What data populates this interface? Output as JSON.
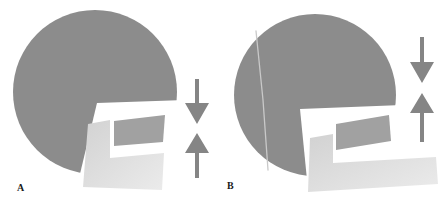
{
  "figure": {
    "type": "schematic-diagram",
    "panel_count": 2
  },
  "colors": {
    "background": "#ffffff",
    "skull": "#8c8c8c",
    "quad": "#a1a1a1",
    "jaw_light": "#d2d2d2",
    "jaw_light_fade": "#ebebeb",
    "arrow": "#858585",
    "fracture_line": "#c9c9c9",
    "label": "#1a1a1a"
  },
  "icons": {
    "down_arrow": "arrow-down",
    "up_arrow": "arrow-up"
  },
  "panels": [
    {
      "label": "A",
      "skull": {
        "cx": 95,
        "cy": 92,
        "r": 82
      },
      "notch_points": "79,178 97,103 185,100 196,200 85,200",
      "jaw_points": "88,124 110,120 110,158 164,153 162,190 83,187",
      "quad_points": "114,121 165,115 163,142 114,146",
      "down_arrow_points": "195,79 199,79 199,103 209,103 197,124 185,103 195,103",
      "up_arrow_points": "197,133 209,153 199,153 199,178 195,178 195,153 185,153"
    },
    {
      "label": "B",
      "skull": {
        "cx": 315,
        "cy": 95,
        "r": 81
      },
      "fracture_points": "256,31 263,100 268,170",
      "notch_points": "300,109 402,105 414,200 309,200",
      "jaw_points": "310,138 333,134 333,163 436,157 438,184 308,192",
      "quad_points": "336,124 389,115 391,141 336,150",
      "down_arrow_points": "420,37 424,37 424,62 434,62 422,83 410,62 420,62",
      "up_arrow_points": "422,93 434,113 424,113 424,142 420,142 420,113 410,113"
    }
  ]
}
